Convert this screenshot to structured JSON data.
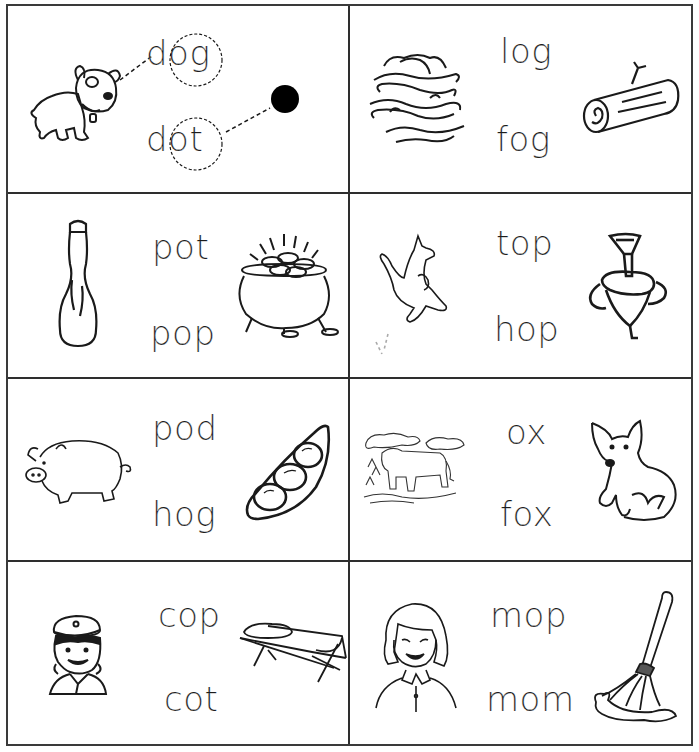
{
  "worksheet": {
    "title": "Short o word-picture matching",
    "example": {
      "words": [
        "dog",
        "dot"
      ],
      "circled_part": [
        "og",
        "ot"
      ],
      "pictures": [
        "dog",
        "dot"
      ]
    },
    "cells": [
      {
        "id": "example",
        "words": [
          "dog",
          "dot"
        ],
        "left_picture": "dog",
        "right_picture": "dot"
      },
      {
        "id": "log-fog",
        "words": [
          "log",
          "fog"
        ],
        "left_picture": "fog",
        "right_picture": "log"
      },
      {
        "id": "pot-pop",
        "words": [
          "pot",
          "pop"
        ],
        "left_picture": "pop-bottle",
        "right_picture": "pot-of-gold"
      },
      {
        "id": "top-hop",
        "words": [
          "top",
          "hop"
        ],
        "left_picture": "hopping-kangaroo",
        "right_picture": "spinning-top"
      },
      {
        "id": "pod-hog",
        "words": [
          "pod",
          "hog"
        ],
        "left_picture": "hog",
        "right_picture": "pea-pod"
      },
      {
        "id": "ox-fox",
        "words": [
          "ox",
          "fox"
        ],
        "left_picture": "ox",
        "right_picture": "fox"
      },
      {
        "id": "cop-cot",
        "words": [
          "cop",
          "cot"
        ],
        "left_picture": "cop",
        "right_picture": "cot"
      },
      {
        "id": "mop-mom",
        "words": [
          "mop",
          "mom"
        ],
        "left_picture": "mom",
        "right_picture": "mop"
      }
    ]
  },
  "colors": {
    "ink": "#1a1a1a",
    "grid": "#2e2e2e",
    "paper": "#ffffff"
  }
}
